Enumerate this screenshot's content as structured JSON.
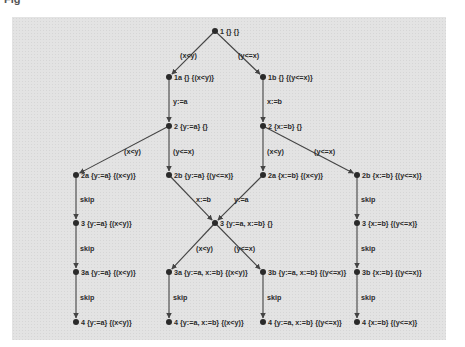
{
  "caption": "Fig",
  "diagram": {
    "colors": {
      "panel": "#e3e3e3",
      "edge": "#444444",
      "node": "#2a2a2a",
      "text": "#2b2b2b"
    },
    "nodes": [
      {
        "id": "n1",
        "x": 215,
        "y": 31,
        "label": "1 {} {}"
      },
      {
        "id": "n1a",
        "x": 169,
        "y": 77,
        "label": "1a {} {(x<y)}"
      },
      {
        "id": "n1b",
        "x": 263,
        "y": 77,
        "label": "1b {} {(y<=x)}"
      },
      {
        "id": "n2L",
        "x": 169,
        "y": 126,
        "label": "2 {y:=a} {}"
      },
      {
        "id": "n2R",
        "x": 263,
        "y": 126,
        "label": "2 {x:=b} {}"
      },
      {
        "id": "n2aL",
        "x": 76,
        "y": 175,
        "label": "2a {y:=a} {(x<y)}"
      },
      {
        "id": "n2bL",
        "x": 169,
        "y": 175,
        "label": "2b {y:=a} {(y<=x)}"
      },
      {
        "id": "n2aR",
        "x": 263,
        "y": 175,
        "label": "2a {x:=b} {(x<y)}"
      },
      {
        "id": "n2bR",
        "x": 357,
        "y": 175,
        "label": "2b {x:=b} {(y<=x)}"
      },
      {
        "id": "n3L",
        "x": 76,
        "y": 223,
        "label": "3 {y:=a} {(x<y)}"
      },
      {
        "id": "n3C",
        "x": 215,
        "y": 223,
        "label": "3 {y:=a, x:=b} {}"
      },
      {
        "id": "n3R",
        "x": 357,
        "y": 223,
        "label": "3 {x:=b} {(y<=x)}"
      },
      {
        "id": "n3aL",
        "x": 76,
        "y": 272,
        "label": "3a {y:=a} {(x<y)}"
      },
      {
        "id": "n3aC",
        "x": 169,
        "y": 272,
        "label": "3a {y:=a, x:=b} {(x<y)}"
      },
      {
        "id": "n3bC",
        "x": 263,
        "y": 272,
        "label": "3b {y:=a, x:=b} {(y<=x)}"
      },
      {
        "id": "n3bR",
        "x": 357,
        "y": 272,
        "label": "3b {x:=b} {(y<=x)}"
      },
      {
        "id": "n4L",
        "x": 76,
        "y": 322,
        "label": "4 {y:=a} {(x<y)}"
      },
      {
        "id": "n4CL",
        "x": 169,
        "y": 322,
        "label": "4 {y:=a, x:=b} {(x<y)}"
      },
      {
        "id": "n4CR",
        "x": 263,
        "y": 322,
        "label": "4 {y:=a, x:=b} {(y<=x)}"
      },
      {
        "id": "n4R",
        "x": 357,
        "y": 322,
        "label": "4 {x:=b} {(y<=x)}"
      }
    ],
    "edges": [
      {
        "from": "n1",
        "to": "n1a",
        "label": "(x<y)",
        "lx": 180,
        "ly": 58
      },
      {
        "from": "n1",
        "to": "n1b",
        "label": "(y<=x)",
        "lx": 238,
        "ly": 58
      },
      {
        "from": "n1a",
        "to": "n2L",
        "label": "y:=a",
        "lx": 173,
        "ly": 104
      },
      {
        "from": "n1b",
        "to": "n2R",
        "label": "x:=b",
        "lx": 267,
        "ly": 104
      },
      {
        "from": "n2L",
        "to": "n2aL",
        "label": "(x<y)",
        "lx": 124,
        "ly": 154
      },
      {
        "from": "n2L",
        "to": "n2bL",
        "label": "(y<=x)",
        "lx": 173,
        "ly": 154
      },
      {
        "from": "n2R",
        "to": "n2aR",
        "label": "(x<y)",
        "lx": 267,
        "ly": 154
      },
      {
        "from": "n2R",
        "to": "n2bR",
        "label": "(y<=x)",
        "lx": 314,
        "ly": 154
      },
      {
        "from": "n2aL",
        "to": "n3L",
        "label": "skip",
        "lx": 80,
        "ly": 202
      },
      {
        "from": "n2bL",
        "to": "n3C",
        "label": "x:=b",
        "lx": 196,
        "ly": 202
      },
      {
        "from": "n2aR",
        "to": "n3C",
        "label": "y:=a",
        "lx": 234,
        "ly": 202
      },
      {
        "from": "n2bR",
        "to": "n3R",
        "label": "skip",
        "lx": 361,
        "ly": 202
      },
      {
        "from": "n3L",
        "to": "n3aL",
        "label": "skip",
        "lx": 80,
        "ly": 251
      },
      {
        "from": "n3C",
        "to": "n3aC",
        "label": "(x<y)",
        "lx": 196,
        "ly": 251
      },
      {
        "from": "n3C",
        "to": "n3bC",
        "label": "(y<=x)",
        "lx": 234,
        "ly": 251
      },
      {
        "from": "n3R",
        "to": "n3bR",
        "label": "skip",
        "lx": 361,
        "ly": 251
      },
      {
        "from": "n3aL",
        "to": "n4L",
        "label": "skip",
        "lx": 80,
        "ly": 300
      },
      {
        "from": "n3aC",
        "to": "n4CL",
        "label": "skip",
        "lx": 173,
        "ly": 300
      },
      {
        "from": "n3bC",
        "to": "n4CR",
        "label": "skip",
        "lx": 267,
        "ly": 300
      },
      {
        "from": "n3bR",
        "to": "n4R",
        "label": "skip",
        "lx": 361,
        "ly": 300
      }
    ]
  }
}
